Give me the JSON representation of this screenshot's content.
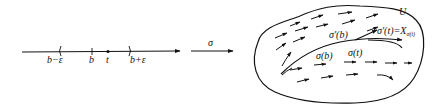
{
  "diagram": {
    "interval": {
      "labels": {
        "left": "b−ε",
        "point_b": "b",
        "point_t": "t",
        "right": "b+ε"
      }
    },
    "map": {
      "label": "σ"
    },
    "region": {
      "label": "U",
      "curve_labels": {
        "sigma_b": "σ(b)",
        "sigma_t": "σ(t)",
        "tangent_b": "σ′(b)",
        "tangent_t": "σ′(t)=X",
        "tangent_t_sub": "σ(t)"
      }
    },
    "colors": {
      "stroke": "#111111",
      "background": "#ffffff"
    }
  }
}
